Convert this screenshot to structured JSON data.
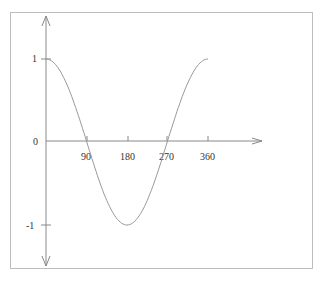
{
  "chart_data": {
    "type": "line",
    "title": "",
    "xlabel": "",
    "ylabel": "",
    "function": "cos(x)",
    "x_ticks": [
      "90",
      "180",
      "270",
      "360"
    ],
    "y_ticks": [
      "1",
      "0",
      "-1"
    ],
    "xlim": [
      0,
      360
    ],
    "ylim": [
      -1,
      1
    ],
    "grid": false,
    "series": [
      {
        "name": "cos(x)",
        "x": [
          0,
          30,
          60,
          90,
          120,
          150,
          180,
          210,
          240,
          270,
          300,
          330,
          360
        ],
        "values": [
          1,
          0.866,
          0.5,
          0,
          -0.5,
          -0.866,
          -1,
          -0.866,
          -0.5,
          0,
          0.5,
          0.866,
          1
        ]
      }
    ]
  },
  "labels": {
    "x90": "90",
    "x180": "180",
    "x270": "270",
    "x360": "360",
    "y1": "1",
    "y0": "0",
    "yneg1": "-1"
  }
}
